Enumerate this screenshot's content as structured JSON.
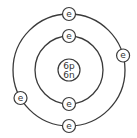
{
  "diagram": {
    "type": "bohr-model",
    "nucleus": {
      "protons_label": "6p",
      "neutrons_label": "6n"
    },
    "electron_label": "e",
    "shells": [
      {
        "name": "inner",
        "electron_count": 2,
        "electron_angles_deg": [
          270,
          90
        ]
      },
      {
        "name": "outer",
        "electron_count": 4,
        "electron_angles_deg": [
          270,
          345,
          90,
          150
        ]
      }
    ],
    "colors": {
      "stroke": "#3a3a3a",
      "text": "#333333",
      "background": "#ffffff"
    }
  }
}
